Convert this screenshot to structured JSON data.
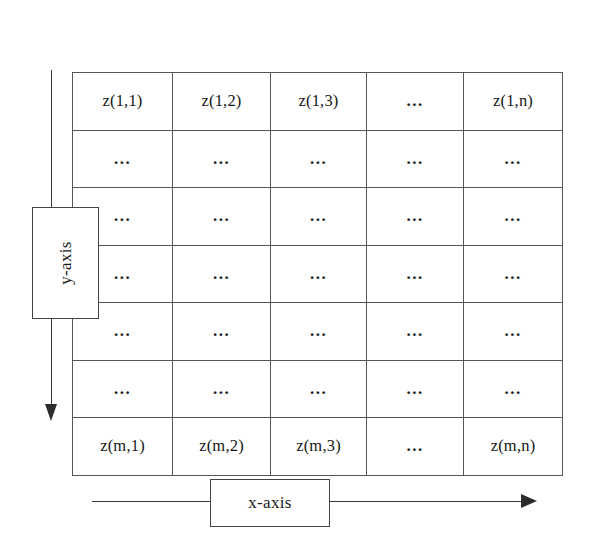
{
  "figure": {
    "type": "diagram",
    "background_color": "#ffffff",
    "line_color": "#444444",
    "text_color": "#171717"
  },
  "axes": {
    "x": {
      "label": "x-axis",
      "direction": "right",
      "arrow_icon": "arrow-right-icon"
    },
    "y": {
      "label": "y-axis",
      "direction": "down",
      "arrow_icon": "arrow-down-icon"
    }
  },
  "grid": {
    "ellipsis": "...",
    "row_count": 7,
    "column_count": 5,
    "rows": [
      {
        "id": "row-first",
        "cells": [
          "z(1,1)",
          "z(1,2)",
          "z(1,3)",
          "...",
          "z(1,n)"
        ]
      },
      {
        "id": "row-ellipsis-1",
        "cells": [
          "...",
          "...",
          "...",
          "...",
          "..."
        ]
      },
      {
        "id": "row-ellipsis-2",
        "cells": [
          "...",
          "...",
          "...",
          "...",
          "..."
        ]
      },
      {
        "id": "row-ellipsis-3",
        "cells": [
          "...",
          "...",
          "...",
          "...",
          "..."
        ]
      },
      {
        "id": "row-ellipsis-4",
        "cells": [
          "...",
          "...",
          "...",
          "...",
          "..."
        ]
      },
      {
        "id": "row-ellipsis-5",
        "cells": [
          "...",
          "...",
          "...",
          "...",
          "..."
        ]
      },
      {
        "id": "row-last",
        "cells": [
          "z(m,1)",
          "z(m,2)",
          "z(m,3)",
          "...",
          "z(m,n)"
        ]
      }
    ]
  }
}
